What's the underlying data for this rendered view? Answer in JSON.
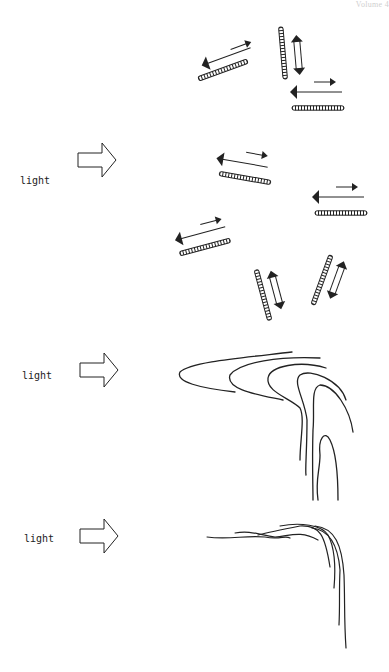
{
  "header": {
    "text": "Volume 4"
  },
  "panels": [
    {
      "id": "panel-1",
      "label": "",
      "description": "Random orientation of chloroplast pairs with movement arrows (no light)"
    },
    {
      "id": "panel-2",
      "label": "light",
      "description": "Orientation of chloroplasts under light from the left"
    },
    {
      "id": "panel-3",
      "label": "light",
      "description": "Folded curved strands response to light"
    },
    {
      "id": "panel-4",
      "label": "light",
      "description": "Thin strands bending toward light"
    }
  ],
  "colors": {
    "ink": "#222222",
    "background": "#ffffff",
    "faint": "#cfcfcf"
  }
}
